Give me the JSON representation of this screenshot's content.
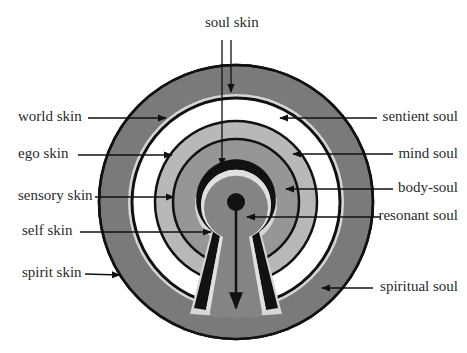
{
  "diagram": {
    "title_label": "soul skin",
    "colors": {
      "outer_ring": "#7a7a7a",
      "skin_stripe": "#d6d6d6",
      "sentient_soul": "#ffffff",
      "mind_soul": "#b8b8b8",
      "body_soul": "#929292",
      "resonant_soul": "#8a8a8a",
      "line": "#111111"
    },
    "left_labels": [
      {
        "id": "world-skin",
        "text": "world skin"
      },
      {
        "id": "ego-skin",
        "text": "ego skin"
      },
      {
        "id": "sensory-skin",
        "text": "sensory skin"
      },
      {
        "id": "self-skin",
        "text": "self skin"
      },
      {
        "id": "spirit-skin",
        "text": "spirit skin"
      }
    ],
    "right_labels": [
      {
        "id": "sentient-soul",
        "text": "sentient soul"
      },
      {
        "id": "mind-soul",
        "text": "mind soul"
      },
      {
        "id": "body-soul",
        "text": "body-soul"
      },
      {
        "id": "resonant-soul",
        "text": "resonant soul"
      },
      {
        "id": "spiritual-soul",
        "text": "spiritual soul"
      }
    ],
    "top_label": {
      "id": "soul-skin",
      "text": "soul skin"
    }
  }
}
